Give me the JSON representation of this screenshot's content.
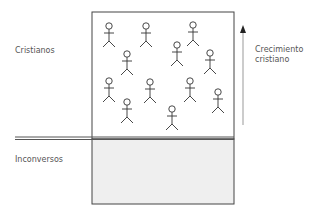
{
  "diagram": {
    "labels": {
      "top_left": "Cristianos",
      "bottom_left": "Inconversos",
      "arrow_line1": "Crecimiento",
      "arrow_line2": "cristiano"
    },
    "figures": [
      {
        "x": 109,
        "y": 26
      },
      {
        "x": 146,
        "y": 26
      },
      {
        "x": 193,
        "y": 25
      },
      {
        "x": 177,
        "y": 45
      },
      {
        "x": 127,
        "y": 54
      },
      {
        "x": 210,
        "y": 53
      },
      {
        "x": 109,
        "y": 81
      },
      {
        "x": 150,
        "y": 82
      },
      {
        "x": 190,
        "y": 81
      },
      {
        "x": 127,
        "y": 102
      },
      {
        "x": 218,
        "y": 92
      },
      {
        "x": 172,
        "y": 109
      }
    ],
    "colors": {
      "line": "#444444",
      "fill_bottom": "#efefef"
    }
  }
}
